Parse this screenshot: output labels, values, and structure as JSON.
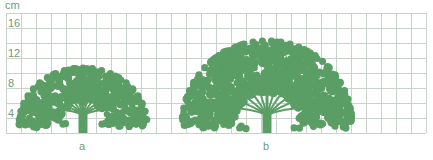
{
  "diagram": {
    "unit": "cm",
    "y_axis": {
      "ticks": [
        {
          "label": "16",
          "value": 16
        },
        {
          "label": "12",
          "value": 12
        },
        {
          "label": "8",
          "value": 8
        },
        {
          "label": "4",
          "value": 4
        }
      ],
      "range": [
        0,
        16
      ],
      "grid_step_cm": 2
    },
    "grid": {
      "rows": 8,
      "cols": 28
    },
    "trees": [
      {
        "label": "a",
        "height_cm": 9,
        "crown_width_cells": 9
      },
      {
        "label": "b",
        "height_cm": 12.5,
        "crown_width_cells": 11.5
      }
    ],
    "colors": {
      "tree": "#5b9e65",
      "grid": "#c9d3cc",
      "label": "#6f9a7a",
      "background": "#ffffff"
    }
  }
}
